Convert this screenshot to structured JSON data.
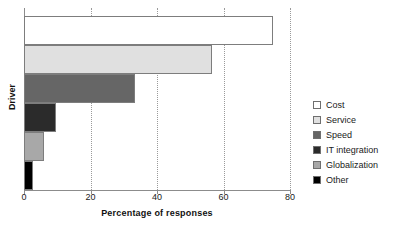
{
  "chart_data": {
    "type": "bar",
    "orientation": "horizontal",
    "title": "",
    "xlabel": "Percentage of responses",
    "ylabel": "Driver",
    "xlim": [
      0,
      80
    ],
    "xticks": [
      0,
      20,
      40,
      60,
      80
    ],
    "xticklabels": [
      "0",
      "20",
      "40",
      "60",
      "80"
    ],
    "grid": "vertical-dotted",
    "legend_position": "right",
    "categories": [
      "Cost",
      "Service",
      "Speed",
      "IT integration",
      "Globalization",
      "Other"
    ],
    "values": [
      75,
      56.5,
      33.5,
      9.5,
      6,
      2.7
    ],
    "colors": [
      "#ffffff",
      "#e0e0e0",
      "#666666",
      "#2b2b2b",
      "#a8a8a8",
      "#000000"
    ],
    "bar_edge_color": "#7d7d7d",
    "axis_color": "#8c8c8c",
    "gridline_color": "#9a9a9a",
    "bars": [
      {
        "label": "Cost",
        "value": 75,
        "color": "#ffffff"
      },
      {
        "label": "Service",
        "value": 56.5,
        "color": "#e0e0e0"
      },
      {
        "label": "Speed",
        "value": 33.5,
        "color": "#666666"
      },
      {
        "label": "IT integration",
        "value": 9.5,
        "color": "#2b2b2b"
      },
      {
        "label": "Globalization",
        "value": 6,
        "color": "#a8a8a8"
      },
      {
        "label": "Other",
        "value": 2.7,
        "color": "#000000"
      }
    ]
  },
  "legend": {
    "items": [
      {
        "label": "Cost",
        "color": "#ffffff"
      },
      {
        "label": "Service",
        "color": "#e0e0e0"
      },
      {
        "label": "Speed",
        "color": "#666666"
      },
      {
        "label": "IT integration",
        "color": "#2b2b2b"
      },
      {
        "label": "Globalization",
        "color": "#a8a8a8"
      },
      {
        "label": "Other",
        "color": "#000000"
      }
    ]
  }
}
